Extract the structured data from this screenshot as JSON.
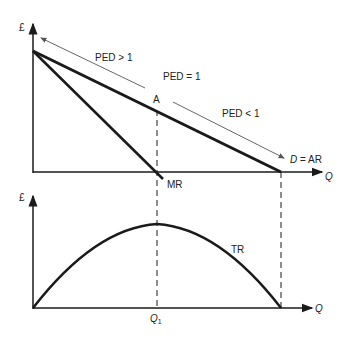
{
  "diagram": {
    "top_panel": {
      "y_axis_label": "£",
      "x_axis_label": "Q",
      "demand_label_italic": "D",
      "demand_label_rest": " = AR",
      "mr_label": "MR",
      "point_label": "A",
      "ped_elastic": "PED > 1",
      "ped_unit": "PED = 1",
      "ped_inelastic": "PED < 1"
    },
    "bottom_panel": {
      "y_axis_label": "£",
      "x_axis_label": "Q",
      "tr_label": "TR",
      "q1_label": "Q",
      "q1_sub": "1"
    },
    "colors": {
      "line": "#1a1a1a",
      "arrow": "#555555",
      "background": "#ffffff"
    }
  }
}
